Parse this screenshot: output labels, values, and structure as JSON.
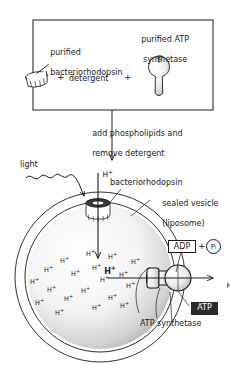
{
  "figure": {
    "width": 230,
    "height": 367,
    "colors": {
      "ink": "#1a1a1a",
      "paper": "#ffffff",
      "atp_box_fill": "#2b2b2b",
      "atp_box_text": "#ffffff",
      "stipple": "#9a9a9a"
    }
  },
  "top_box": {
    "left_label": "purified\nbacteriorhodopsin",
    "left_label_line1": "purified",
    "left_label_line2": "bacteriorhodopsin",
    "right_label_line1": "purified ATP",
    "right_label_line2": "synthetase",
    "middle_label": "detergent",
    "plus_1": "+",
    "plus_2": "+",
    "left_icon_name": "bacteriorhodopsin-cylinder-icon",
    "right_icon_name": "atp-synthetase-lollipop-icon"
  },
  "process_arrow": {
    "caption_line1": "add phospholipids and",
    "caption_line2": "remove detergent"
  },
  "vesicle": {
    "light_label": "light",
    "proton_out_label": "H",
    "proton_out_sup": "+",
    "bacteriorhodopsin_label": "bacteriorhodopsin",
    "sealed_vesicle_line1": "sealed vesicle",
    "sealed_vesicle_line2": "(liposome)",
    "atp_synthetase_label": "ATP synthetase",
    "proton_right_label": "H",
    "proton_right_sup": "+",
    "interior_proton_label": "H",
    "interior_proton_sup": "+",
    "interior_protons": [
      {
        "x": 86,
        "y": 251
      },
      {
        "x": 108,
        "y": 254
      },
      {
        "x": 60,
        "y": 258
      },
      {
        "x": 131,
        "y": 259
      },
      {
        "x": 44,
        "y": 267
      },
      {
        "x": 92,
        "y": 265
      },
      {
        "x": 71,
        "y": 271
      },
      {
        "x": 119,
        "y": 272
      },
      {
        "x": 30,
        "y": 279
      },
      {
        "x": 100,
        "y": 277
      },
      {
        "x": 47,
        "y": 287
      },
      {
        "x": 81,
        "y": 288
      },
      {
        "x": 126,
        "y": 283
      },
      {
        "x": 64,
        "y": 296
      },
      {
        "x": 108,
        "y": 295
      },
      {
        "x": 35,
        "y": 300
      },
      {
        "x": 92,
        "y": 305
      },
      {
        "x": 55,
        "y": 310
      },
      {
        "x": 120,
        "y": 303
      }
    ],
    "highlight_proton": {
      "x": 93,
      "y": 260
    }
  },
  "reaction": {
    "adp_label": "ADP",
    "plus_label": "+",
    "pi_label": "P",
    "pi_subscript": "i",
    "atp_label": "ATP"
  }
}
